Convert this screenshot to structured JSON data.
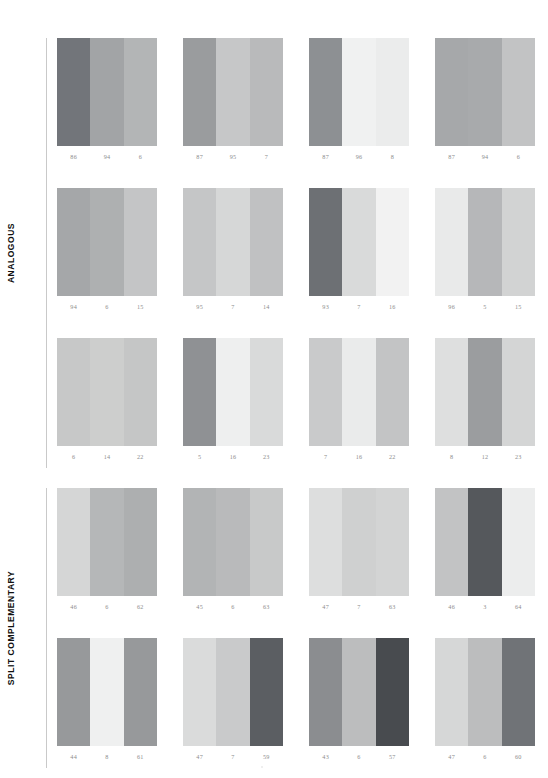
{
  "page": {
    "background": "#ffffff",
    "width": 548,
    "height": 778,
    "number_color": "#8e8e8e",
    "label_color": "#101010",
    "rule_color": "#c9c9c9"
  },
  "sections": [
    {
      "label": "ANALOGOUS",
      "top": 38,
      "height": 430,
      "rows": [
        {
          "groups": [
            {
              "numbers": [
                "86",
                "94",
                "6"
              ],
              "colors": [
                "#72757a",
                "#a2a4a6",
                "#b3b5b6"
              ]
            },
            {
              "numbers": [
                "87",
                "95",
                "7"
              ],
              "colors": [
                "#9a9c9e",
                "#c6c7c8",
                "#b9babb"
              ]
            },
            {
              "numbers": [
                "87",
                "96",
                "8"
              ],
              "colors": [
                "#8d9093",
                "#f0f1f1",
                "#ebecec"
              ]
            },
            {
              "numbers": [
                "87",
                "94",
                "6"
              ],
              "colors": [
                "#a6a8aa",
                "#a8aaac",
                "#c2c3c4"
              ]
            }
          ]
        },
        {
          "groups": [
            {
              "numbers": [
                "94",
                "6",
                "15"
              ],
              "colors": [
                "#a5a7a9",
                "#aeb0b1",
                "#c4c5c6"
              ]
            },
            {
              "numbers": [
                "95",
                "7",
                "14"
              ],
              "colors": [
                "#c5c6c7",
                "#d6d7d7",
                "#c0c1c2"
              ]
            },
            {
              "numbers": [
                "93",
                "7",
                "16"
              ],
              "colors": [
                "#6d7074",
                "#d9dada",
                "#f2f2f2"
              ]
            },
            {
              "numbers": [
                "96",
                "5",
                "15"
              ],
              "colors": [
                "#e9eaea",
                "#b6b7b9",
                "#d2d3d3"
              ]
            }
          ]
        },
        {
          "groups": [
            {
              "numbers": [
                "6",
                "14",
                "22"
              ],
              "colors": [
                "#c7c8c8",
                "#cdcecd",
                "#c5c6c6"
              ]
            },
            {
              "numbers": [
                "5",
                "16",
                "23"
              ],
              "colors": [
                "#8f9194",
                "#eeefef",
                "#d9dada"
              ]
            },
            {
              "numbers": [
                "7",
                "16",
                "22"
              ],
              "colors": [
                "#c9cacb",
                "#eaebeb",
                "#c3c4c5"
              ]
            },
            {
              "numbers": [
                "8",
                "12",
                "23"
              ],
              "colors": [
                "#dedfdf",
                "#9b9d9f",
                "#d4d5d5"
              ]
            }
          ]
        }
      ]
    },
    {
      "label": "SPLIT COMPLEMENTARY",
      "top": 488,
      "height": 280,
      "rows": [
        {
          "groups": [
            {
              "numbers": [
                "46",
                "6",
                "62"
              ],
              "colors": [
                "#d5d6d6",
                "#b5b7b8",
                "#adafb0"
              ]
            },
            {
              "numbers": [
                "45",
                "6",
                "63"
              ],
              "colors": [
                "#b2b4b5",
                "#b9babb",
                "#c8c9c9"
              ]
            },
            {
              "numbers": [
                "47",
                "7",
                "63"
              ],
              "colors": [
                "#dddede",
                "#cfd0d0",
                "#d3d4d4"
              ]
            },
            {
              "numbers": [
                "46",
                "3",
                "64"
              ],
              "colors": [
                "#c2c3c4",
                "#55585c",
                "#eceded"
              ]
            }
          ]
        },
        {
          "groups": [
            {
              "numbers": [
                "44",
                "8",
                "61"
              ],
              "colors": [
                "#97999b",
                "#eff0f0",
                "#97999b"
              ]
            },
            {
              "numbers": [
                "47",
                "7",
                "59"
              ],
              "colors": [
                "#dadbdb",
                "#c9cacb",
                "#5b5e62"
              ]
            },
            {
              "numbers": [
                "43",
                "6",
                "57"
              ],
              "colors": [
                "#8b8d90",
                "#bcbdbe",
                "#484b4f"
              ]
            },
            {
              "numbers": [
                "47",
                "6",
                "60"
              ],
              "colors": [
                "#d6d7d7",
                "#bcbdbe",
                "#707377"
              ]
            }
          ]
        }
      ]
    }
  ],
  "layout": {
    "group_left_offsets": [
      0,
      126,
      252,
      378
    ],
    "row_height": 150,
    "swatch_width": 100,
    "swatch_height": 108
  }
}
